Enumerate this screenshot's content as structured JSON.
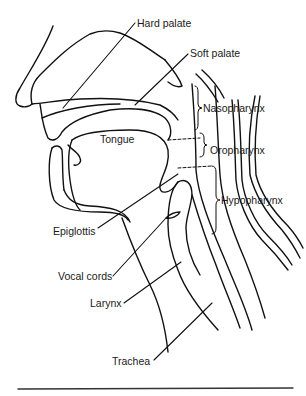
{
  "figure": {
    "labels": {
      "hard_palate": "Hard palate",
      "soft_palate": "Soft palate",
      "nasopharynx": "Nasopharynx",
      "tongue": "Tongue",
      "oropharynx": "Oropharynx",
      "hypopharynx": "Hypopharynx",
      "epiglottis": "Epiglottis",
      "vocal_cords": "Vocal cords",
      "larynx": "Larynx",
      "trachea": "Trachea"
    },
    "colors": {
      "line": "#111111",
      "text": "#1a1a1a",
      "background": "#ffffff"
    }
  }
}
